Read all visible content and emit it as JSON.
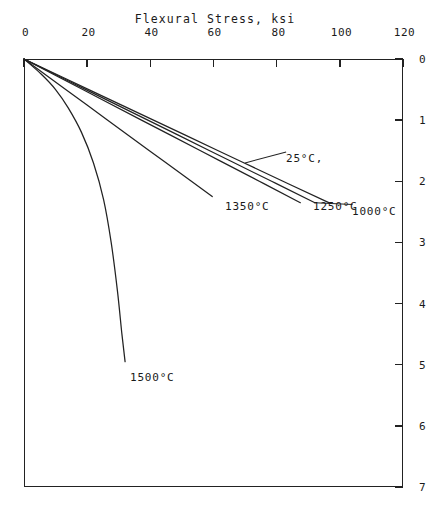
{
  "figure": {
    "background_color": "#ffffff",
    "ink_color": "#222222",
    "orientation_note": "rotated-90-clockwise"
  },
  "chart_data": {
    "type": "line",
    "title": "",
    "xlabel": "Strain, in/in x 10",
    "xlabel_exponent": "-3",
    "ylabel": "Flexural Stress, ksi",
    "xlim": [
      0,
      7
    ],
    "ylim": [
      0,
      120
    ],
    "xticks": [
      0,
      1,
      2,
      3,
      4,
      5,
      6,
      7
    ],
    "xticklabels": [
      "0",
      "1",
      "2",
      "3",
      "4",
      "5",
      "6",
      "7"
    ],
    "yticks": [
      0,
      20,
      40,
      60,
      80,
      100,
      120
    ],
    "yticklabels": [
      "0",
      "20",
      "40",
      "60",
      "80",
      "100",
      "120"
    ],
    "grid": false,
    "legend_position": "inline-annotations",
    "series": [
      {
        "name": "25°C,",
        "label": "25°C,",
        "points": [
          [
            0,
            0
          ],
          [
            0.5,
            20.5
          ],
          [
            1.0,
            41
          ],
          [
            1.5,
            61.5
          ],
          [
            2.0,
            82
          ],
          [
            2.35,
            96.5
          ]
        ]
      },
      {
        "name": "1000°C",
        "label": "1000°C",
        "points": [
          [
            0,
            0
          ],
          [
            0.5,
            19.6
          ],
          [
            1.0,
            39.2
          ],
          [
            1.5,
            58.8
          ],
          [
            2.0,
            78.4
          ],
          [
            2.35,
            92.1
          ]
        ]
      },
      {
        "name": "1250°C",
        "label": "1250°C",
        "points": [
          [
            0,
            0
          ],
          [
            0.5,
            18.6
          ],
          [
            1.0,
            37.2
          ],
          [
            1.5,
            55.9
          ],
          [
            2.0,
            74.5
          ],
          [
            2.35,
            87.5
          ]
        ]
      },
      {
        "name": "1350°C",
        "label": "1350°C",
        "points": [
          [
            0,
            0
          ],
          [
            0.5,
            13.2
          ],
          [
            1.0,
            26.5
          ],
          [
            1.5,
            39.7
          ],
          [
            2.0,
            53.0
          ],
          [
            2.25,
            59.6
          ]
        ]
      },
      {
        "name": "1500°C",
        "label": "1500°C",
        "points": [
          [
            0,
            0
          ],
          [
            0.25,
            5.5
          ],
          [
            0.5,
            10.0
          ],
          [
            0.8,
            14.0
          ],
          [
            1.2,
            18.2
          ],
          [
            1.7,
            22.0
          ],
          [
            2.3,
            25.2
          ],
          [
            3.0,
            27.6
          ],
          [
            3.8,
            29.6
          ],
          [
            4.5,
            31.0
          ],
          [
            4.95,
            32.0
          ]
        ]
      }
    ],
    "annotations": [
      {
        "text": "25°C,",
        "attached_to": "25°C,"
      },
      {
        "text": "1000°C",
        "attached_to": "1000°C"
      },
      {
        "text": "1250°C",
        "attached_to": "1250°C"
      },
      {
        "text": "1350°C",
        "attached_to": "1350°C"
      },
      {
        "text": "1500°C",
        "attached_to": "1500°C"
      }
    ]
  }
}
